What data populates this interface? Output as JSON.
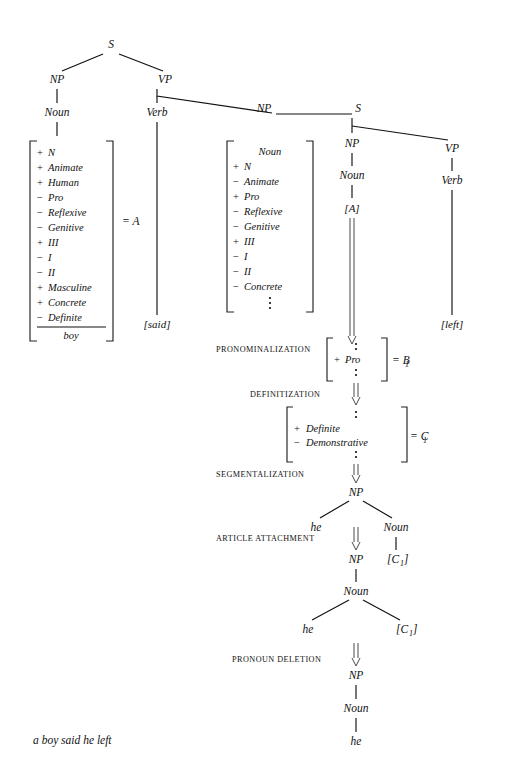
{
  "figure": {
    "caption": "a boy said he left",
    "background": "#ffffff",
    "ink": "#111111"
  },
  "base_tree": {
    "root": "S",
    "nodes": {
      "np_left": "NP",
      "vp": "VP",
      "noun_left": "Noun",
      "verb": "Verb",
      "np_object": "NP",
      "s_embedded": "S",
      "np_embedded": "NP",
      "vp_embedded": "VP",
      "noun_embedded": "Noun",
      "verb_embedded": "Verb"
    },
    "leaves": {
      "said": "[said]",
      "left": "[left]",
      "a_bracket": "[A]"
    }
  },
  "matrix_a": {
    "label": "= A",
    "baseform": "boy",
    "features": [
      {
        "sign": "+",
        "name": "N"
      },
      {
        "sign": "+",
        "name": "Animate"
      },
      {
        "sign": "+",
        "name": "Human"
      },
      {
        "sign": "−",
        "name": "Pro"
      },
      {
        "sign": "−",
        "name": "Reflexive"
      },
      {
        "sign": "−",
        "name": "Genitive"
      },
      {
        "sign": "+",
        "name": "III"
      },
      {
        "sign": "−",
        "name": "I"
      },
      {
        "sign": "−",
        "name": "II"
      },
      {
        "sign": "+",
        "name": "Masculine"
      },
      {
        "sign": "+",
        "name": "Concrete"
      },
      {
        "sign": "−",
        "name": "Definite"
      }
    ]
  },
  "matrix_b": {
    "header": "Noun",
    "features": [
      {
        "sign": "+",
        "name": "N"
      },
      {
        "sign": "−",
        "name": "Animate"
      },
      {
        "sign": "+",
        "name": "Pro"
      },
      {
        "sign": "−",
        "name": "Reflexive"
      },
      {
        "sign": "−",
        "name": "Genitive"
      },
      {
        "sign": "+",
        "name": "III"
      },
      {
        "sign": "−",
        "name": "I"
      },
      {
        "sign": "−",
        "name": "II"
      },
      {
        "sign": "−",
        "name": "Concrete"
      }
    ]
  },
  "matrix_b1": {
    "label": "= B",
    "sublabel": "1",
    "features": [
      {
        "sign": "+",
        "name": "Pro"
      }
    ]
  },
  "matrix_c1": {
    "label": "= C",
    "sublabel": "1",
    "features": [
      {
        "sign": "+",
        "name": "Definite"
      },
      {
        "sign": "−",
        "name": "Demonstrative"
      }
    ]
  },
  "rules": [
    {
      "id": "pronominalization",
      "label": "PRONOMINALIZATION"
    },
    {
      "id": "definitization",
      "label": "DEFINITIZATION"
    },
    {
      "id": "segmentalization",
      "label": "SEGMENTALIZATION"
    },
    {
      "id": "article-attachment",
      "label": "ARTICLE ATTACHMENT"
    },
    {
      "id": "pronoun-deletion",
      "label": "PRONOUN DELETION"
    }
  ],
  "derivation": {
    "seg_tree": {
      "root": "NP",
      "left_leaf": "he",
      "right_node": "Noun",
      "right_leaf": "[C",
      "right_leaf_sub": "1",
      "right_leaf_close": "]"
    },
    "art_tree": {
      "root": "NP",
      "child": "Noun",
      "left_leaf": "he",
      "right_leaf": "[C",
      "right_leaf_sub": "1",
      "right_leaf_close": "]"
    },
    "final_tree": {
      "root": "NP",
      "child": "Noun",
      "leaf": "he"
    }
  }
}
